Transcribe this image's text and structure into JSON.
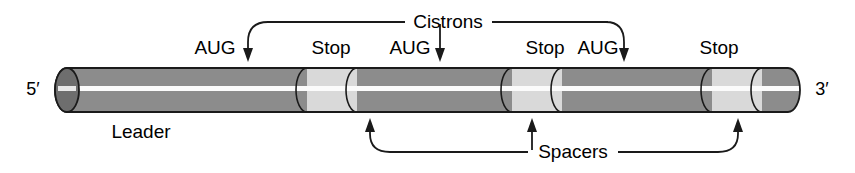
{
  "figure": {
    "ends": {
      "five_prime": "5′",
      "three_prime": "3′"
    },
    "group_labels": {
      "cistrons": "Cistrons",
      "spacers": "Spacers"
    },
    "region_labels": {
      "leader": "Leader"
    },
    "codon_labels": [
      {
        "text": "AUG",
        "x": 215
      },
      {
        "text": "Stop",
        "x": 331
      },
      {
        "text": "AUG",
        "x": 440
      },
      {
        "text": "Stop",
        "x": 545
      },
      {
        "text": "AUG",
        "x": 623
      },
      {
        "text": "Stop",
        "x": 719
      }
    ],
    "colors": {
      "cistron_fill": "#8c8c8c",
      "spacer_fill": "#d9d9d9",
      "cap_fill": "#6e6e6e",
      "highlight": "#f2f2f2",
      "outline": "#1a1a1a",
      "text": "#000000"
    },
    "tube": {
      "left": 55,
      "right": 800,
      "top": 68,
      "bottom": 112,
      "segments": [
        {
          "kind": "cistron",
          "start": 55,
          "end": 307
        },
        {
          "kind": "spacer",
          "start": 307,
          "end": 357
        },
        {
          "kind": "cistron",
          "start": 357,
          "end": 512
        },
        {
          "kind": "spacer",
          "start": 512,
          "end": 562
        },
        {
          "kind": "cistron",
          "start": 562,
          "end": 712
        },
        {
          "kind": "spacer",
          "start": 712,
          "end": 762
        },
        {
          "kind": "cistron",
          "start": 762,
          "end": 800
        }
      ]
    },
    "pointers": {
      "cistron_arrow_x": [
        248,
        440,
        624
      ],
      "spacer_arrow_x": [
        370,
        532,
        738
      ]
    }
  }
}
